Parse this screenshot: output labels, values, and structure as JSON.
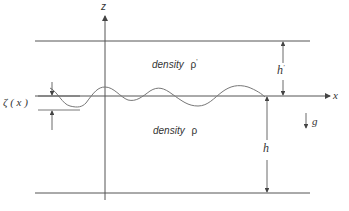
{
  "diagram": {
    "type": "two-layer fluid interface schematic",
    "axes": {
      "vertical_label": "z",
      "horizontal_label": "x"
    },
    "upper_layer": {
      "label": "density",
      "symbol": "ρ",
      "prime": "'",
      "thickness_label": "h",
      "thickness_prime": "'"
    },
    "lower_layer": {
      "label": "density",
      "symbol": "ρ",
      "thickness_label": "h"
    },
    "interface_displacement": {
      "label": "ζ ( x )"
    },
    "gravity": {
      "label": "g"
    },
    "colors": {
      "lines": "#555555",
      "wave": "#777777",
      "text": "#333333"
    }
  }
}
